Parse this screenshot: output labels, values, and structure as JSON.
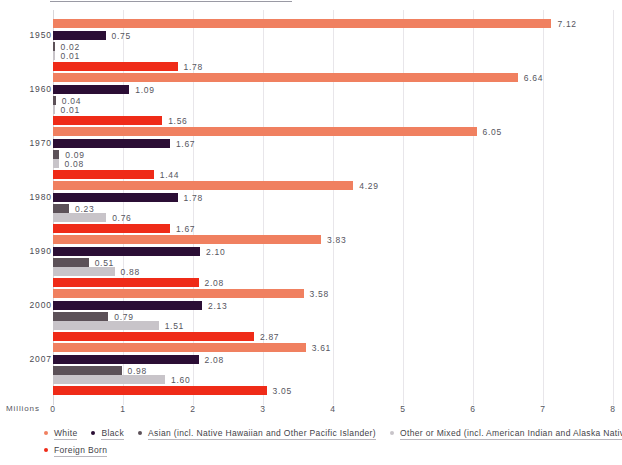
{
  "chart_data": {
    "type": "bar",
    "orientation": "horizontal",
    "title": "",
    "xlabel": "Millions",
    "ylabel": "",
    "xlim": [
      0,
      8
    ],
    "xticks": [
      "0",
      "1",
      "2",
      "3",
      "4",
      "5",
      "6",
      "7",
      "8"
    ],
    "grid": true,
    "legend_position": "bottom-left",
    "categories": [
      "1950",
      "1960",
      "1970",
      "1980",
      "1990",
      "2000",
      "2007"
    ],
    "series": [
      {
        "name": "White",
        "color": "#f08060",
        "values": [
          7.12,
          6.64,
          6.05,
          4.29,
          3.83,
          3.58,
          3.61
        ]
      },
      {
        "name": "Black",
        "color": "#2b0e35",
        "values": [
          0.75,
          1.09,
          1.67,
          1.78,
          2.1,
          2.13,
          2.08
        ]
      },
      {
        "name": "Asian (incl. Native Hawaiian and Other Pacific Islander)",
        "color": "#5c5158",
        "values": [
          0.02,
          0.04,
          0.09,
          0.23,
          0.51,
          0.79,
          0.98
        ]
      },
      {
        "name": "Other or Mixed (incl. American Indian and Alaska Native)",
        "color": "#c8c4c9",
        "values": [
          0.01,
          0.01,
          0.08,
          0.76,
          0.88,
          1.51,
          1.6
        ]
      },
      {
        "name": "Foreign Born",
        "color": "#ef2b18",
        "values": [
          1.78,
          1.56,
          1.44,
          1.67,
          2.08,
          2.87,
          3.05
        ]
      }
    ],
    "value_labels": {
      "1950": {
        "White": "7.12",
        "Black": "0.75",
        "Asian": "0.02",
        "Other": "0.01",
        "Foreign Born": "1.78"
      },
      "1960": {
        "White": "6.64",
        "Black": "1.09",
        "Asian": "0.04",
        "Other": "0.01",
        "Foreign Born": "1.56"
      },
      "1970": {
        "White": "6.05",
        "Black": "1.67",
        "Asian": "0.09",
        "Other": "0.08",
        "Foreign Born": "1.44"
      },
      "1980": {
        "White": "4.29",
        "Black": "1.78",
        "Asian": "0.23",
        "Other": "0.76",
        "Foreign Born": "1.67"
      },
      "1990": {
        "White": "3.83",
        "Black": "2.10",
        "Asian": "0.51",
        "Other": "0.88",
        "Foreign Born": "2.08"
      },
      "2000": {
        "White": "3.58",
        "Black": "2.13",
        "Asian": "0.79",
        "Other": "1.51",
        "Foreign Born": "2.87"
      },
      "2007": {
        "White": "3.61",
        "Black": "2.08",
        "Asian": "0.98",
        "Other": "1.60",
        "Foreign Born": "3.05"
      }
    }
  },
  "axis": {
    "x_caption": "Millions",
    "ticks": [
      "0",
      "1",
      "2",
      "3",
      "4",
      "5",
      "6",
      "7",
      "8"
    ]
  },
  "years": [
    {
      "label": "1950"
    },
    {
      "label": "1960"
    },
    {
      "label": "1970"
    },
    {
      "label": "1980"
    },
    {
      "label": "1990"
    },
    {
      "label": "2000"
    },
    {
      "label": "2007"
    }
  ],
  "legend": {
    "rows": [
      [
        {
          "label": "White",
          "color": "#f08060"
        },
        {
          "label": "Black",
          "color": "#2b0e35"
        },
        {
          "label": "Asian (incl. Native Hawaiian and Other Pacific Islander)",
          "color": "#5c5158"
        },
        {
          "label": "Other or Mixed (incl. American Indian and Alaska Native)",
          "color": "#c8c4c9"
        }
      ],
      [
        {
          "label": "Foreign Born",
          "color": "#ef2b18"
        }
      ]
    ]
  }
}
